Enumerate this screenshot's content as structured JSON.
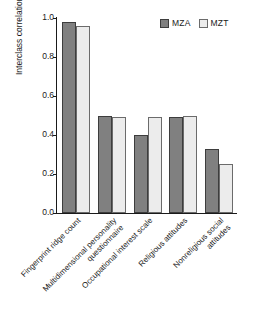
{
  "chart_data": {
    "type": "bar",
    "title": "",
    "xlabel": "",
    "ylabel": "Interclass correlations",
    "ylim": [
      0.0,
      1.0
    ],
    "ytick_labels": [
      "0.0",
      "0.2",
      "0.4",
      "0.6",
      "0.8",
      "1.0"
    ],
    "ytick_values": [
      0.0,
      0.2,
      0.4,
      0.6,
      0.8,
      1.0
    ],
    "grid": false,
    "legend_position": "top-right",
    "categories": [
      "Fingerprint ridge count",
      "Multidimensional personality\nquestionnaire",
      "Occupational interest scale",
      "Religious attitudes",
      "Nonreligious social\nattitudes"
    ],
    "series": [
      {
        "name": "MZA",
        "color": "#808080",
        "values": [
          0.98,
          0.5,
          0.4,
          0.49,
          0.33
        ]
      },
      {
        "name": "MZT",
        "color": "#ececec",
        "values": [
          0.96,
          0.49,
          0.49,
          0.5,
          0.25
        ]
      }
    ]
  },
  "legend": {
    "items": [
      {
        "label": "MZA"
      },
      {
        "label": "MZT"
      }
    ]
  }
}
